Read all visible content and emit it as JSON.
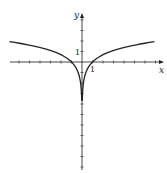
{
  "chart_data": {
    "type": "line",
    "title": "",
    "function": "y = ln|x|",
    "xlabel": "x",
    "ylabel": "y",
    "tick_labels": {
      "x": "1",
      "y": "1"
    },
    "xlim": [
      -7,
      7.8
    ],
    "ylim": [
      -10,
      4.8
    ],
    "grid": false,
    "series": [
      {
        "name": "ln|x|",
        "x": [
          -6.9,
          -4,
          -2,
          -1,
          -0.5,
          -0.1,
          -0.02
        ],
        "y": [
          1.93,
          1.39,
          0.69,
          0,
          -0.69,
          -2.3,
          -3.9
        ]
      },
      {
        "name": "ln|x| (right)",
        "x": [
          0.02,
          0.1,
          0.5,
          1,
          2,
          4,
          6.9
        ],
        "y": [
          -3.9,
          -2.3,
          -0.69,
          0,
          0.69,
          1.39,
          1.93
        ]
      }
    ]
  },
  "axes": {
    "x_label": "x",
    "y_label": "y",
    "x_one": "1",
    "y_one": "1"
  }
}
